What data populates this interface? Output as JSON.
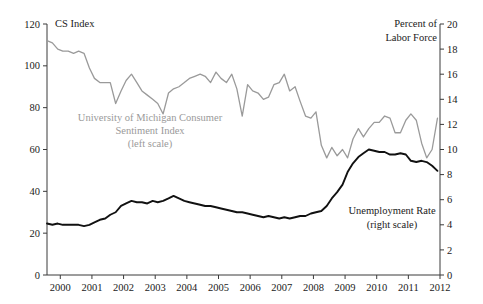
{
  "chart_data": {
    "type": "line",
    "title": "",
    "xlabel": "",
    "ylabel": "CS Index",
    "y2label": "Percent of Labor Force",
    "grid": false,
    "legend_position": "inline-annotations",
    "xlim": [
      1999.58,
      2012.0
    ],
    "ylim": [
      0,
      120
    ],
    "y2lim": [
      0,
      20
    ],
    "xticks": [
      "2000",
      "2001",
      "2002",
      "2003",
      "2004",
      "2005",
      "2006",
      "2007",
      "2008",
      "2009",
      "2010",
      "2011",
      "2012"
    ],
    "yticks": [
      "0",
      "20",
      "40",
      "60",
      "80",
      "100",
      "120"
    ],
    "y2ticks": [
      "0",
      "2",
      "4",
      "6",
      "8",
      "10",
      "12",
      "14",
      "16",
      "18",
      "20"
    ],
    "series": [
      {
        "name": "University of Michigan Consumer Sentiment Index",
        "axis": "left",
        "color": "#9a9a9a",
        "x": [
          1999.58,
          1999.75,
          1999.92,
          2000.08,
          2000.25,
          2000.42,
          2000.58,
          2000.75,
          2000.92,
          2001.08,
          2001.25,
          2001.42,
          2001.58,
          2001.75,
          2001.92,
          2002.08,
          2002.25,
          2002.42,
          2002.58,
          2002.75,
          2002.92,
          2003.08,
          2003.25,
          2003.42,
          2003.58,
          2003.75,
          2003.92,
          2004.08,
          2004.25,
          2004.42,
          2004.58,
          2004.75,
          2004.92,
          2005.08,
          2005.25,
          2005.42,
          2005.58,
          2005.75,
          2005.92,
          2006.08,
          2006.25,
          2006.42,
          2006.58,
          2006.75,
          2006.92,
          2007.08,
          2007.25,
          2007.42,
          2007.58,
          2007.75,
          2007.92,
          2008.08,
          2008.25,
          2008.42,
          2008.58,
          2008.75,
          2008.92,
          2009.08,
          2009.25,
          2009.42,
          2009.58,
          2009.75,
          2009.92,
          2010.08,
          2010.25,
          2010.42,
          2010.58,
          2010.75,
          2010.92,
          2011.08,
          2011.25,
          2011.42,
          2011.58,
          2011.75,
          2011.92
        ],
        "values": [
          112,
          111,
          108,
          107,
          107,
          106,
          107,
          106,
          99,
          94,
          92,
          92,
          92,
          82,
          88,
          93,
          96,
          92,
          88,
          86,
          84,
          82,
          77,
          87,
          89,
          90,
          92,
          94,
          95,
          96,
          95,
          92,
          97,
          94,
          92,
          96,
          89,
          76,
          91,
          88,
          87,
          84,
          85,
          91,
          92,
          96,
          88,
          90,
          83,
          76,
          75,
          78,
          62,
          56,
          61,
          57,
          60,
          56,
          65,
          70,
          66,
          70,
          73,
          73,
          76,
          75,
          68,
          68,
          74,
          77,
          74,
          63,
          56,
          60,
          75
        ]
      },
      {
        "name": "Unemployment Rate",
        "axis": "right",
        "color": "#111111",
        "x": [
          1999.58,
          1999.75,
          1999.92,
          2000.08,
          2000.25,
          2000.42,
          2000.58,
          2000.75,
          2000.92,
          2001.08,
          2001.25,
          2001.42,
          2001.58,
          2001.75,
          2001.92,
          2002.08,
          2002.25,
          2002.42,
          2002.58,
          2002.75,
          2002.92,
          2003.08,
          2003.25,
          2003.42,
          2003.58,
          2003.75,
          2003.92,
          2004.08,
          2004.25,
          2004.42,
          2004.58,
          2004.75,
          2004.92,
          2005.08,
          2005.25,
          2005.42,
          2005.58,
          2005.75,
          2005.92,
          2006.08,
          2006.25,
          2006.42,
          2006.58,
          2006.75,
          2006.92,
          2007.08,
          2007.25,
          2007.42,
          2007.58,
          2007.75,
          2007.92,
          2008.08,
          2008.25,
          2008.42,
          2008.58,
          2008.75,
          2008.92,
          2009.08,
          2009.25,
          2009.42,
          2009.58,
          2009.75,
          2009.92,
          2010.08,
          2010.25,
          2010.42,
          2010.58,
          2010.75,
          2010.92,
          2011.08,
          2011.25,
          2011.42,
          2011.58,
          2011.75,
          2011.92
        ],
        "values": [
          4.1,
          4.0,
          4.1,
          4.0,
          4.0,
          4.0,
          4.0,
          3.9,
          4.0,
          4.2,
          4.4,
          4.5,
          4.8,
          5.0,
          5.5,
          5.7,
          5.9,
          5.8,
          5.8,
          5.7,
          5.9,
          5.8,
          5.9,
          6.1,
          6.3,
          6.1,
          5.9,
          5.8,
          5.7,
          5.6,
          5.5,
          5.5,
          5.4,
          5.3,
          5.2,
          5.1,
          5.0,
          5.0,
          4.9,
          4.8,
          4.7,
          4.6,
          4.7,
          4.6,
          4.5,
          4.6,
          4.5,
          4.6,
          4.7,
          4.7,
          4.9,
          5.0,
          5.1,
          5.5,
          6.1,
          6.6,
          7.2,
          8.2,
          8.9,
          9.4,
          9.7,
          10.0,
          9.9,
          9.8,
          9.8,
          9.6,
          9.6,
          9.7,
          9.6,
          9.1,
          9.0,
          9.1,
          9.0,
          8.7,
          8.3
        ]
      }
    ],
    "annotations": [
      {
        "name": "cs-index-axis-title",
        "text": "CS Index"
      },
      {
        "name": "percent-labor-force-line1",
        "text": "Percent of"
      },
      {
        "name": "percent-labor-force-line2",
        "text": "Labor Force"
      },
      {
        "name": "umich-annotation-line1",
        "text": "University of Michigan Consumer"
      },
      {
        "name": "umich-annotation-line2",
        "text": "Sentiment Index"
      },
      {
        "name": "umich-annotation-line3",
        "text": "(left scale)"
      },
      {
        "name": "unemployment-annotation-line1",
        "text": "Unemployment Rate"
      },
      {
        "name": "unemployment-annotation-line2",
        "text": "(right scale)"
      }
    ]
  },
  "labels": {
    "cs_index": "CS Index",
    "percent_of": "Percent of",
    "labor_force": "Labor Force",
    "umich_1": "University of Michigan Consumer",
    "umich_2": "Sentiment Index",
    "umich_3": "(left scale)",
    "unemp_1": "Unemployment Rate",
    "unemp_2": "(right scale)"
  },
  "colors": {
    "cs_series": "#9a9a9a",
    "unemployment_series": "#111111",
    "axis": "#3a3a3a",
    "background": "#ffffff"
  }
}
